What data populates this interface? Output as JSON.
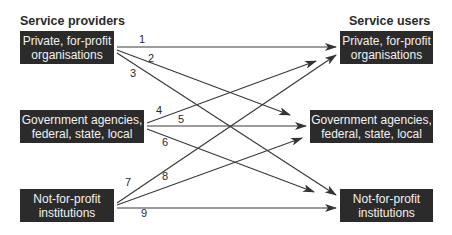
{
  "headings": {
    "providers": "Service providers",
    "users": "Service users"
  },
  "providers": [
    {
      "line1": "Private, for-profit",
      "line2": "organisations"
    },
    {
      "line1": "Government agencies,",
      "line2": "federal, state, local"
    },
    {
      "line1": "Not-for-profit",
      "line2": "institutions"
    }
  ],
  "users": [
    {
      "line1": "Private, for-profit",
      "line2": "organisations"
    },
    {
      "line1": "Government agencies,",
      "line2": "federal, state, local"
    },
    {
      "line1": "Not-for-profit",
      "line2": "institutions"
    }
  ],
  "arrows": [
    {
      "label": "1",
      "from": "Private, for-profit organisations",
      "to": "Private, for-profit organisations"
    },
    {
      "label": "2",
      "from": "Private, for-profit organisations",
      "to": "Government agencies, federal, state, local"
    },
    {
      "label": "3",
      "from": "Private, for-profit organisations",
      "to": "Not-for-profit institutions"
    },
    {
      "label": "4",
      "from": "Government agencies, federal, state, local",
      "to": "Private, for-profit organisations"
    },
    {
      "label": "5",
      "from": "Government agencies, federal, state, local",
      "to": "Government agencies, federal, state, local"
    },
    {
      "label": "6",
      "from": "Government agencies, federal, state, local",
      "to": "Not-for-profit institutions"
    },
    {
      "label": "7",
      "from": "Not-for-profit institutions",
      "to": "Private, for-profit organisations"
    },
    {
      "label": "8",
      "from": "Not-for-profit institutions",
      "to": "Government agencies, federal, state, local"
    },
    {
      "label": "9",
      "from": "Not-for-profit institutions",
      "to": "Not-for-profit institutions"
    }
  ],
  "colors": {
    "box_fill": "#2b2b2b",
    "box_text": "#f2f2f2",
    "line": "#3a3a3a"
  }
}
